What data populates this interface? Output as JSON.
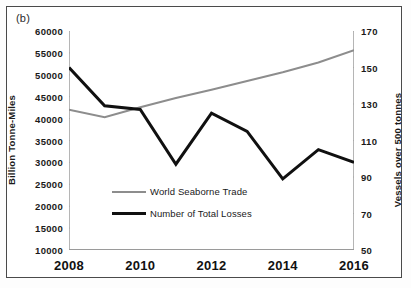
{
  "figure": {
    "panel_label": "(b)"
  },
  "chart_data": {
    "type": "line",
    "title": "",
    "xlabel": "",
    "ylabel": "Billion Tonne-Miles",
    "y2label": "Vessels over 500 tonnes",
    "x": [
      2008,
      2009,
      2010,
      2011,
      2012,
      2013,
      2014,
      2015,
      2016
    ],
    "xlim": [
      2008,
      2016
    ],
    "xticks": [
      2008,
      2010,
      2012,
      2014,
      2016
    ],
    "xtick_labels": [
      "2008",
      "2010",
      "2012",
      "2014",
      "2016"
    ],
    "xminor_ticks": [
      2009,
      2011,
      2013,
      2015
    ],
    "ylim": [
      10000,
      60000
    ],
    "yticks": [
      10000,
      15000,
      20000,
      25000,
      30000,
      35000,
      40000,
      45000,
      50000,
      55000,
      60000
    ],
    "ytick_labels": [
      "10000",
      "15000",
      "20000",
      "25000",
      "30000",
      "35000",
      "40000",
      "45000",
      "50000",
      "55000",
      "60000"
    ],
    "y2lim": [
      50,
      170
    ],
    "y2ticks": [
      50,
      70,
      90,
      110,
      130,
      150,
      170
    ],
    "y2tick_labels": [
      "50",
      "70",
      "90",
      "110",
      "130",
      "150",
      "170"
    ],
    "grid": false,
    "legend_position": "center",
    "series": [
      {
        "name": "World Seaborne Trade",
        "axis": "left",
        "color": "#8d8d8d",
        "width": 2,
        "values": [
          42000,
          40300,
          42600,
          44700,
          46600,
          48600,
          50600,
          52800,
          55600
        ]
      },
      {
        "name": "Number of Total Losses",
        "axis": "right",
        "color": "#101010",
        "width": 3,
        "values": [
          150,
          129,
          127,
          97,
          125,
          115,
          89,
          105,
          98
        ]
      }
    ]
  },
  "legend": {
    "items": [
      {
        "label": "World Seaborne Trade"
      },
      {
        "label": "Number of Total Losses"
      }
    ]
  }
}
